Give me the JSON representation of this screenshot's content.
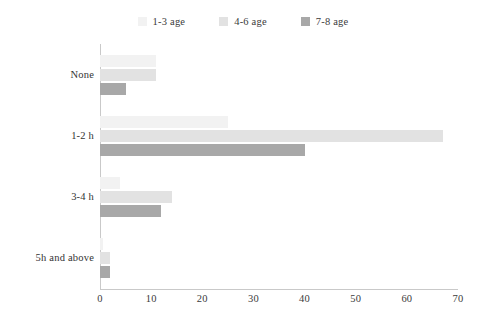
{
  "chart_data": {
    "type": "bar",
    "orientation": "horizontal",
    "title": "",
    "subtitle": "",
    "xlabel": "",
    "ylabel": "",
    "categories": [
      "None",
      "1-2 h",
      "3-4 h",
      "5h and above"
    ],
    "series": [
      {
        "name": "1-3 age",
        "color": "#f2f2f2",
        "values": [
          11,
          25,
          4,
          0.5
        ]
      },
      {
        "name": "4-6 age",
        "color": "#e2e2e2",
        "values": [
          11,
          67,
          14,
          2
        ]
      },
      {
        "name": "7-8 age",
        "color": "#a8a8a8",
        "values": [
          5,
          40,
          12,
          2
        ]
      }
    ],
    "xlim": [
      0,
      70
    ],
    "xticks": [
      0,
      10,
      20,
      30,
      40,
      50,
      60,
      70
    ],
    "xtick_labels": [
      "0",
      "10",
      "20",
      "30",
      "40",
      "50",
      "60",
      "70"
    ],
    "grid": false,
    "legend_position": "top-center",
    "axis_color": "#c9c9c9"
  },
  "legend": {
    "items": [
      {
        "label": "1-3 age",
        "color": "#f2f2f2"
      },
      {
        "label": "4-6 age",
        "color": "#e2e2e2"
      },
      {
        "label": "7-8 age",
        "color": "#a8a8a8"
      }
    ]
  }
}
